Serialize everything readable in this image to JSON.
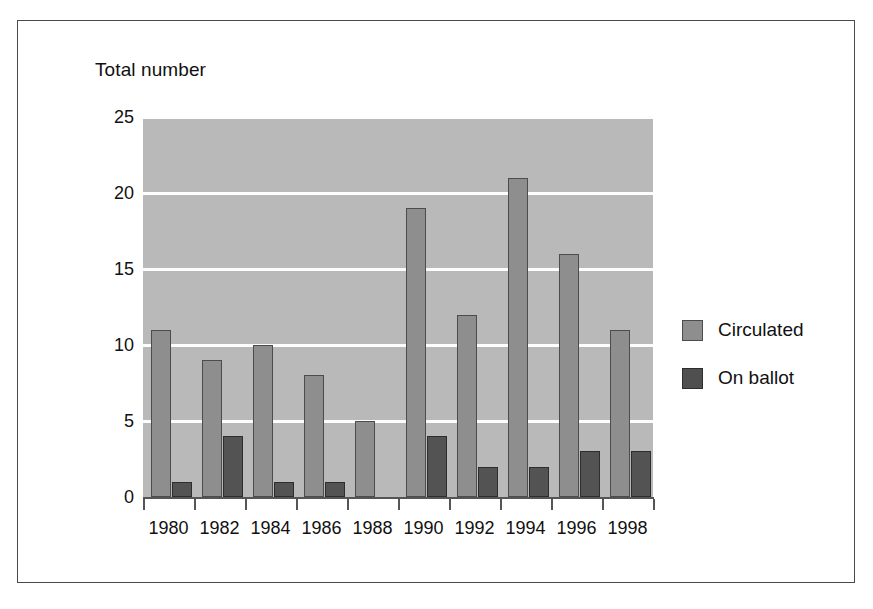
{
  "figure": {
    "axis_title": "Total number",
    "background_color": "#ffffff",
    "plot_background_color": "#b9b9b9",
    "frame_color": "#4a4a4a"
  },
  "legend": {
    "position": "right",
    "items": [
      {
        "label": "Circulated",
        "color": "#8e8e8e",
        "swatch": "circulated-swatch"
      },
      {
        "label": "On ballot",
        "color": "#4f4f4f",
        "swatch": "onballot-swatch"
      }
    ]
  },
  "chart_data": {
    "type": "bar",
    "title": "",
    "xlabel": "",
    "ylabel": "Total number",
    "ylim": [
      0,
      25
    ],
    "yticks": [
      0,
      5,
      10,
      15,
      20,
      25
    ],
    "ytick_labels": [
      "0",
      "5",
      "10",
      "15",
      "20",
      "25"
    ],
    "grid": true,
    "grid_color": "#fdfdfd",
    "legend_position": "right",
    "categories": [
      "1980",
      "1982",
      "1984",
      "1986",
      "1988",
      "1990",
      "1992",
      "1994",
      "1996",
      "1998"
    ],
    "series": [
      {
        "name": "Circulated",
        "color": "#8e8e8e",
        "values": [
          11,
          9,
          10,
          8,
          5,
          19,
          12,
          21,
          16,
          11
        ]
      },
      {
        "name": "On ballot",
        "color": "#4f4f4f",
        "values": [
          1,
          4,
          1,
          1,
          0,
          4,
          2,
          2,
          3,
          3
        ]
      }
    ]
  }
}
